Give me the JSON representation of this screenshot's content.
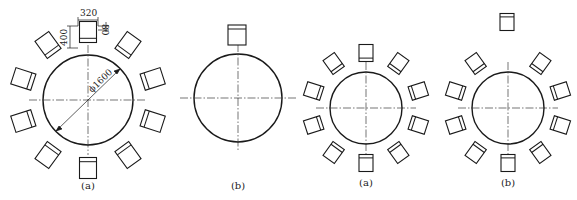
{
  "figures": [
    {
      "id": "fig1",
      "label": "(a)",
      "cx": 88,
      "cy": 100,
      "r": 45,
      "chair_radius": 68,
      "chair_angles": [
        0,
        36,
        72,
        108,
        144,
        180,
        216,
        252,
        288,
        324
      ],
      "displaced_chair": null,
      "dimensions": {
        "chair_width": "320",
        "chair_depth": "400",
        "backrest": "80",
        "table_diameter": "ϕ1600"
      }
    },
    {
      "id": "fig2",
      "label": "(b)",
      "cx": 238,
      "cy": 98,
      "r": 44,
      "chair_radius": 0,
      "chair_angles": [],
      "displaced_chair": {
        "x": 237,
        "y": 35
      }
    },
    {
      "id": "fig3",
      "label": "(a)",
      "cx": 366,
      "cy": 108,
      "r": 36,
      "chair_radius": 55,
      "chair_angles": [
        0,
        36,
        72,
        108,
        144,
        180,
        216,
        252,
        288,
        324
      ],
      "displaced_chair": null
    },
    {
      "id": "fig4",
      "label": "(b)",
      "cx": 508,
      "cy": 108,
      "r": 36,
      "chair_radius": 55,
      "chair_angles": [
        36,
        72,
        108,
        144,
        180,
        216,
        252,
        288,
        324
      ],
      "displaced_chair": {
        "x": 507,
        "y": 22
      }
    }
  ],
  "labels": {
    "fig1": "(a)",
    "fig2": "(b)",
    "fig3": "(a)",
    "fig4": "(b)"
  },
  "dims": {
    "w": "320",
    "d": "400",
    "b": "80",
    "dia": "ϕ1600"
  },
  "colors": {
    "stroke": "#1a1a1a",
    "background": "#ffffff"
  }
}
